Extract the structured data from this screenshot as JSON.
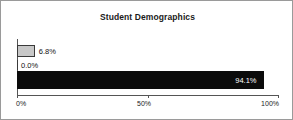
{
  "chart_data": {
    "type": "bar",
    "orientation": "horizontal",
    "title": "Student Demographics",
    "xlabel": "",
    "ylabel": "",
    "xlim": [
      0,
      100
    ],
    "grid": false,
    "legend": false,
    "categories": [
      "",
      "",
      ""
    ],
    "values": [
      6.8,
      0.0,
      94.1
    ],
    "value_labels": [
      "6.8%",
      "0.0%",
      "94.1%"
    ],
    "bar_styles": [
      "light-gray",
      "empty",
      "black"
    ],
    "label_placement": [
      "outside-right",
      "outside-right",
      "inside-right"
    ],
    "axis": {
      "ticks": [
        0,
        50,
        100
      ],
      "tick_labels": [
        "0%",
        "50%",
        "100%"
      ]
    },
    "colors": {
      "light_bar_fill": "#c8c8c8",
      "light_bar_edge": "#3a3a3a",
      "dark_bar_fill": "#0b0b0b",
      "axis": "#555555",
      "text": "#111111",
      "inside_label_text": "#ffffff",
      "frame_border": "#9a9a9a",
      "background": "#ffffff"
    }
  }
}
